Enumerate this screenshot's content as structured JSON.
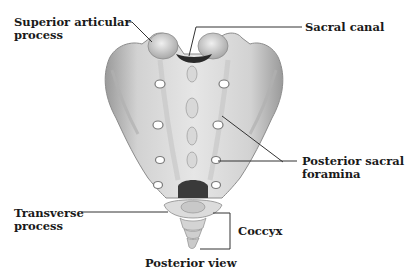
{
  "diagram": {
    "title": "Posterior view",
    "labels": [
      {
        "id": "superior-articular-process",
        "line1": "Superior articular",
        "line2": "process"
      },
      {
        "id": "sacral-canal",
        "line1": "Sacral canal",
        "line2": ""
      },
      {
        "id": "posterior-sacral-foramina",
        "line1": "Posterior sacral",
        "line2": "foramina"
      },
      {
        "id": "transverse-process",
        "line1": "Transverse",
        "line2": "process"
      },
      {
        "id": "coccyx",
        "line1": "Coccyx",
        "line2": ""
      }
    ],
    "caption": "Posterior view"
  },
  "colors": {
    "background": "#ffffff",
    "text": "#1a1a1a",
    "leader_line": "#333333",
    "bone_light": "#e4e4e4",
    "bone_mid": "#bdbdbd",
    "bone_dark": "#8a8a8a",
    "canal": "#2a2a2a"
  }
}
